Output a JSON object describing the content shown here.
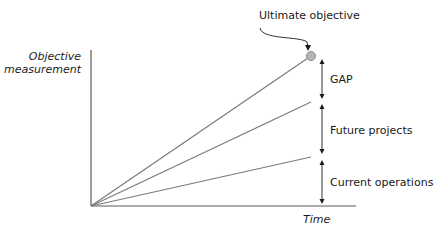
{
  "diagram": {
    "title_annotation": "Ultimate objective",
    "y_axis_label_line1": "Objective",
    "y_axis_label_line2": "measurement",
    "x_axis_label": "Time",
    "segments": [
      {
        "label": "GAP"
      },
      {
        "label": "Future projects"
      },
      {
        "label": "Current operations"
      }
    ],
    "lines": [
      {
        "name": "ultimate-objective-line",
        "end_level": "top"
      },
      {
        "name": "future-projects-line",
        "end_level": "middle"
      },
      {
        "name": "current-operations-line",
        "end_level": "bottom"
      }
    ],
    "colors": {
      "axis": "#5a5a5a",
      "lines": "#7a7a7a",
      "marker_fill": "#b5b5b5",
      "marker_stroke": "#8a8a8a",
      "text": "#1a1a1a"
    }
  }
}
